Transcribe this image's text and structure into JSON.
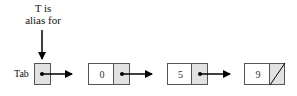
{
  "caption": {
    "line1": "T is",
    "line2": "alias for"
  },
  "head": {
    "label": "Tab"
  },
  "nodes": [
    {
      "value": "0",
      "next": "pointer"
    },
    {
      "value": "5",
      "next": "pointer"
    },
    {
      "value": "9",
      "next": "null"
    }
  ],
  "colors": {
    "border": "#555555",
    "pointer_cell": "#e2e2e2",
    "arrow": "#000000"
  }
}
